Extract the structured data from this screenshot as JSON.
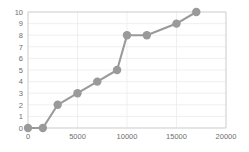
{
  "chart_data": {
    "type": "line",
    "title": "",
    "subtitle": "",
    "xlabel": "",
    "ylabel": "",
    "xlim": [
      0,
      20000
    ],
    "ylim": [
      0,
      10
    ],
    "grid": true,
    "legend": null,
    "legend_position": "none",
    "marker": "circle",
    "line_color": "#9a9a9a",
    "marker_color": "#9a9a9a",
    "grid_color": "#e9e9e9",
    "axis_color": "#c9c9c9",
    "tick_label_color": "#6e6e6e",
    "x": [
      0,
      1500,
      3000,
      5000,
      7000,
      9000,
      10000,
      12000,
      15000,
      17000
    ],
    "y": [
      0,
      0,
      2,
      3,
      4,
      5,
      8,
      8,
      9,
      10
    ],
    "points": [
      {
        "x": 0,
        "y": 0
      },
      {
        "x": 1500,
        "y": 0
      },
      {
        "x": 3000,
        "y": 2
      },
      {
        "x": 5000,
        "y": 3
      },
      {
        "x": 7000,
        "y": 4
      },
      {
        "x": 9000,
        "y": 5
      },
      {
        "x": 10000,
        "y": 8
      },
      {
        "x": 12000,
        "y": 8
      },
      {
        "x": 15000,
        "y": 9
      },
      {
        "x": 17000,
        "y": 10
      }
    ],
    "xticks": [
      0,
      5000,
      10000,
      15000,
      20000
    ],
    "xtick_labels": [
      "0",
      "5000",
      "10000",
      "15000",
      "20000"
    ],
    "yticks": [
      0,
      1,
      2,
      3,
      4,
      5,
      6,
      7,
      8,
      9,
      10
    ],
    "ytick_labels": [
      "0",
      "1",
      "2",
      "3",
      "4",
      "5",
      "6",
      "7",
      "8",
      "9",
      "10"
    ]
  },
  "layout": {
    "plot_left": 28,
    "plot_right": 226,
    "plot_top": 12,
    "plot_bottom": 128,
    "marker_radius": 4.2
  }
}
